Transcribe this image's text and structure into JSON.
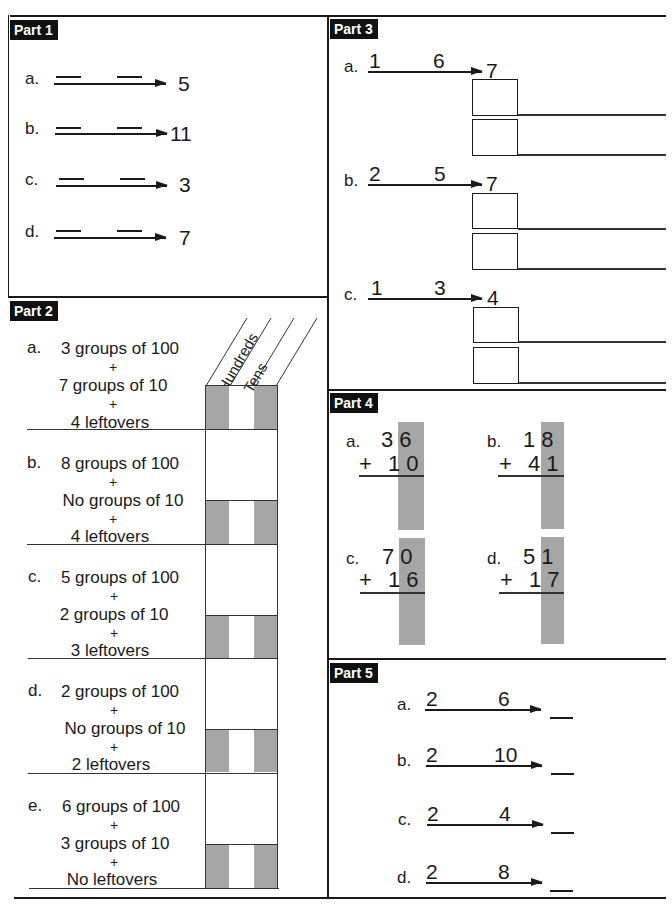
{
  "part1": {
    "tag": "Part 1",
    "items": [
      {
        "label": "a.",
        "result": "5"
      },
      {
        "label": "b.",
        "result": "11"
      },
      {
        "label": "c.",
        "result": "3"
      },
      {
        "label": "d.",
        "result": "7"
      }
    ]
  },
  "part2": {
    "tag": "Part 2",
    "column_headers": [
      "Hundreds",
      "Tens"
    ],
    "items": [
      {
        "label": "a.",
        "hundreds": "3 groups of 100",
        "plus1": "+",
        "tens": "7 groups of 10",
        "plus2": "+",
        "ones": "4 leftovers"
      },
      {
        "label": "b.",
        "hundreds": "8 groups of 100",
        "plus1": "+",
        "tens": "No groups of 10",
        "plus2": "+",
        "ones": "4 leftovers"
      },
      {
        "label": "c.",
        "hundreds": "5 groups of 100",
        "plus1": "+",
        "tens": "2 groups of 10",
        "plus2": "+",
        "ones": "3 leftovers"
      },
      {
        "label": "d.",
        "hundreds": "2 groups of 100",
        "plus1": "+",
        "tens": "No groups of 10",
        "plus2": "+",
        "ones": "2 leftovers"
      },
      {
        "label": "e.",
        "hundreds": "6 groups of 100",
        "plus1": "+",
        "tens": "3 groups of 10",
        "plus2": "+",
        "ones": "No leftovers"
      }
    ]
  },
  "part3": {
    "tag": "Part 3",
    "items": [
      {
        "label": "a.",
        "first": "1",
        "second": "6",
        "total": "7"
      },
      {
        "label": "b.",
        "first": "2",
        "second": "5",
        "total": "7"
      },
      {
        "label": "c.",
        "first": "1",
        "second": "3",
        "total": "4"
      }
    ]
  },
  "part4": {
    "tag": "Part 4",
    "items": [
      {
        "label": "a.",
        "top": "36",
        "bottom": "+ 10"
      },
      {
        "label": "b.",
        "top": "18",
        "bottom": "+ 41"
      },
      {
        "label": "c.",
        "top": "70",
        "bottom": "+ 16"
      },
      {
        "label": "d.",
        "top": "51",
        "bottom": "+ 17"
      }
    ]
  },
  "part5": {
    "tag": "Part 5",
    "items": [
      {
        "label": "a.",
        "first": "2",
        "second": "6"
      },
      {
        "label": "b.",
        "first": "2",
        "second": "10"
      },
      {
        "label": "c.",
        "first": "2",
        "second": "4"
      },
      {
        "label": "d.",
        "first": "2",
        "second": "8"
      }
    ]
  },
  "colors": {
    "ink": "#1a1a1a",
    "shade": "#a6a6a6",
    "tag_bg": "#111111"
  }
}
